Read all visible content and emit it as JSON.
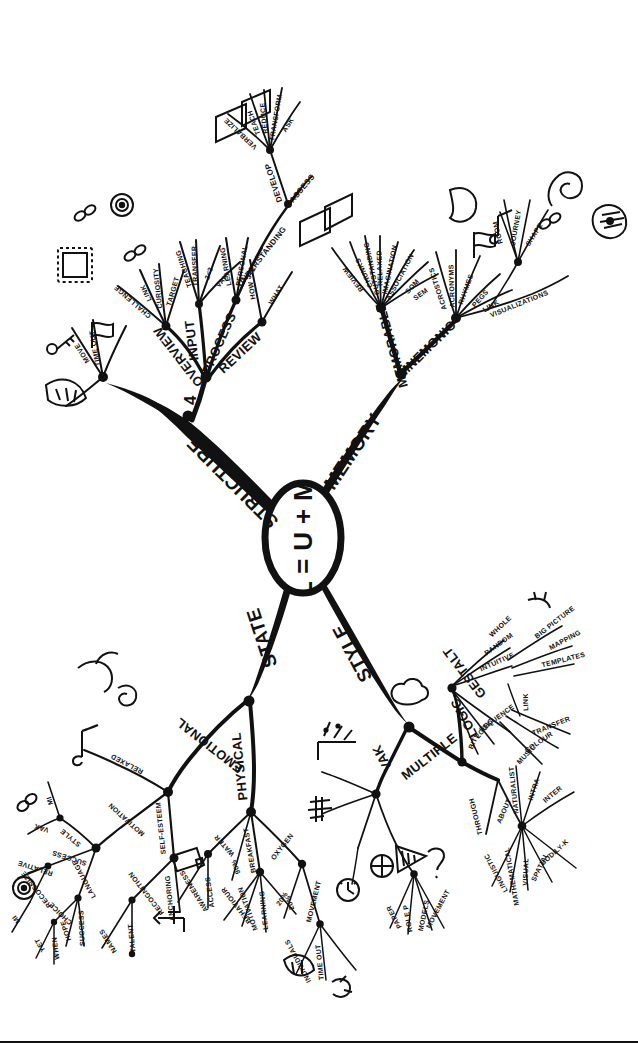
{
  "page": {
    "title": "L = U + M",
    "type": "hand-drawn mind map",
    "width": 638,
    "height": 1043,
    "ink_color": "#111111",
    "background_color": "#ffffff"
  },
  "center": {
    "label": "L = U + M"
  },
  "branches": [
    {
      "id": "structure",
      "label": "STRUCTURE",
      "sub": [
        {
          "label": "4",
          "sub": [
            {
              "label": "OVERVIEW",
              "sub": [
                {
                  "label": "CHALLENGE"
                },
                {
                  "label": "LINK"
                },
                {
                  "label": "CURIOSITY"
                },
                {
                  "label": "TARGET"
                }
              ]
            },
            {
              "label": "INPUT",
              "sub": [
                {
                  "label": "TEACHING"
                },
                {
                  "label": "TRANSFER"
                },
                {
                  "label": "2<3"
                },
                {
                  "label": "VAK"
                }
              ]
            },
            {
              "label": "PROCESS",
              "sub": [
                {
                  "label": "LEARNING"
                },
                {
                  "label": "PERSONAL"
                },
                {
                  "label": "3<2"
                },
                {
                  "label": "UNDERSTANDING",
                  "sub": [
                    {
                      "label": "DEVELOP",
                      "sub": [
                        {
                          "label": "VERBALIZE"
                        },
                        {
                          "label": "TEACH"
                        },
                        {
                          "label": "REDUCE"
                        },
                        {
                          "label": "TRANSFORM"
                        },
                        {
                          "label": "ASK"
                        }
                      ]
                    },
                    {
                      "label": "ASSESS"
                    }
                  ]
                }
              ]
            },
            {
              "label": "REVIEW",
              "sub": [
                {
                  "label": "HOW"
                },
                {
                  "label": "WHAT"
                }
              ]
            }
          ]
        },
        {
          "label": "MOVE"
        },
        {
          "label": "TIME OUT"
        }
      ]
    },
    {
      "id": "memory",
      "label": "MEMORY",
      "sub": [
        {
          "label": "MEMORABLE",
          "sub": [
            {
              "label": "REVIEW"
            },
            {
              "label": "CHUNKS"
            },
            {
              "label": "OUTSTANDING"
            },
            {
              "label": "RELAXED"
            },
            {
              "label": "IMAGINATION"
            },
            {
              "label": "ASSOCIATION"
            },
            {
              "label": "SOM"
            },
            {
              "label": "SEM"
            }
          ]
        },
        {
          "label": "MNEMONIC",
          "sub": [
            {
              "label": "ACROSTICS"
            },
            {
              "label": "ACRONYMS"
            },
            {
              "label": "RHYMES"
            },
            {
              "label": "PEGS"
            },
            {
              "label": "LINK"
            },
            {
              "label": "VISUALIZATIONS",
              "sub": [
                {
                  "label": "ROOM"
                },
                {
                  "label": "JOURNEY"
                },
                {
                  "label": "SHAPE"
                }
              ]
            }
          ]
        }
      ]
    },
    {
      "id": "state",
      "label": "STATE",
      "sub": [
        {
          "label": "EMOTIONAL",
          "sub": [
            {
              "label": "RELAXED"
            },
            {
              "label": "MOTIVATION",
              "sub": [
                {
                  "label": "STYLE",
                  "sub": [
                    {
                      "label": "VAK"
                    },
                    {
                      "label": "MI"
                    }
                  ]
                },
                {
                  "label": "SUCCESS",
                  "sub": [
                    {
                      "label": "RELATIVE"
                    },
                    {
                      "label": "RECOGNIZE"
                    },
                    {
                      "label": "MI"
                    }
                  ]
                },
                {
                  "label": "LANGUAGE",
                  "sub": [
                    {
                      "label": "CHOICE",
                      "sub": [
                        {
                          "label": "YET"
                        },
                        {
                          "label": "WHEN"
                        }
                      ]
                    },
                    {
                      "label": "HOPE"
                    },
                    {
                      "label": "SUCCESS"
                    }
                  ]
                }
              ]
            },
            {
              "label": "SELF-ESTEEM",
              "sub": [
                {
                  "label": "RECOGNITION",
                  "sub": [
                    {
                      "label": "NAMES"
                    },
                    {
                      "label": "TALENT"
                    }
                  ]
                },
                {
                  "label": "ANCHORING"
                }
              ]
            }
          ]
        },
        {
          "label": "PHYSICAL",
          "sub": [
            {
              "label": "WATER",
              "sub": [
                {
                  "label": "AWARENESS"
                },
                {
                  "label": "ACCESS"
                }
              ]
            },
            {
              "label": "BREAKFAST",
              "sub": [
                {
                  "label": "BEHAVIOUR"
                },
                {
                  "label": "MOTIVATION"
                },
                {
                  "label": "LEARNING"
                },
                {
                  "label": "20%"
                }
              ]
            },
            {
              "label": "OXYGEN",
              "sub": [
                {
                  "label": "20%"
                },
                {
                  "label": "MOVEMENT",
                  "sub": [
                    {
                      "label": "INDIVIDUALS"
                    },
                    {
                      "label": "TIME OUT"
                    }
                  ]
                }
              ]
            },
            {
              "label": "90%"
            }
          ]
        }
      ]
    },
    {
      "id": "style",
      "label": "STYLE",
      "sub": [
        {
          "label": "VAK",
          "sub": [
            {
              "label": "PAPER"
            },
            {
              "label": "ROLE P"
            },
            {
              "label": "MODELS"
            },
            {
              "label": "MOVEMENT"
            }
          ]
        },
        {
          "label": "MULTIPLE",
          "sub": [
            {
              "label": "GESTALT",
              "sub": [
                {
                  "label": "WHOLE"
                },
                {
                  "label": "RANDOM"
                },
                {
                  "label": "INTUITIVE"
                },
                {
                  "label": "BIG PICTURE"
                },
                {
                  "label": "MAPPING"
                },
                {
                  "label": "TEMPLATES"
                }
              ]
            },
            {
              "label": "LOGIC",
              "sub": [
                {
                  "label": "BITS"
                },
                {
                  "label": "LOGIC"
                },
                {
                  "label": "SEQUENCE"
                },
                {
                  "label": "MUSIC"
                },
                {
                  "label": "COLOUR"
                },
                {
                  "label": "TRANSFER"
                }
              ]
            },
            {
              "label": "LINK"
            },
            {
              "label": "THROUGH"
            },
            {
              "label": "ABOUT",
              "sub": [
                {
                  "label": "LINGUISTIC"
                },
                {
                  "label": "MATHEMATICAL"
                },
                {
                  "label": "VISUAL"
                },
                {
                  "label": "SPATIAL"
                },
                {
                  "label": "BODILY-K"
                },
                {
                  "label": "INTER"
                },
                {
                  "label": "INTRA"
                },
                {
                  "label": "NATURALIST"
                }
              ]
            }
          ]
        }
      ]
    }
  ],
  "labels": {
    "center": "L = U + M",
    "structure": "STRUCTURE",
    "memory": "MEMORY",
    "state": "STATE",
    "style": "STYLE",
    "four": "4",
    "overview": "OVERVIEW",
    "input": "INPUT",
    "process": "PROCESS",
    "review": "REVIEW",
    "challenge": "CHALLENGE",
    "link": "LINK",
    "curiosity": "CURIOSITY",
    "target": "TARGET",
    "teaching": "TEACHING",
    "transfer": "TRANSFER",
    "two_lt_three": "2<3",
    "vak": "VAK",
    "learning": "LEARNING",
    "personal": "PERSONAL",
    "three_lt_two": "3<2",
    "understanding": "UNDERSTANDING",
    "develop": "DEVELOP",
    "assess": "ASSESS",
    "verbalize": "VERBALIZE",
    "teach": "TEACH",
    "reduce": "REDUCE",
    "transform": "TRANSFORM",
    "ask": "ASK",
    "how": "HOW",
    "what": "WHAT",
    "move": "MOVE",
    "time_out": "TIME OUT",
    "memorable": "MEMORABLE",
    "mnemonic": "MNEMONIC",
    "m_review": "REVIEW",
    "chunks": "CHUNKS",
    "outstanding": "OUTSTANDING",
    "relaxed": "RELAXED",
    "imagination": "IMAGINATION",
    "association": "ASSOCIATION",
    "som": "SOM",
    "sem": "SEM",
    "acrostics": "ACROSTICS",
    "acronyms": "ACRONYMS",
    "rhymes": "RHYMES",
    "pegs": "PEGS",
    "mn_link": "LINK",
    "visualizations": "VISUALIZATIONS",
    "room": "ROOM",
    "journey": "JOURNEY",
    "shape": "SHAPE",
    "emotional": "EMOTIONAL",
    "physical": "PHYSICAL",
    "e_relaxed": "RELAXED",
    "motivation": "MOTIVATION",
    "self_esteem": "SELF-ESTEEM",
    "style_sub": "STYLE",
    "success": "SUCCESS",
    "language": "LANGUAGE",
    "relative": "RELATIVE",
    "recognize": "RECOGNIZE",
    "mi": "MI",
    "mi2": "MI",
    "choice": "CHOICE",
    "hope": "HOPE",
    "success2": "SUCCESS",
    "yet": "YET",
    "when": "WHEN",
    "recognition": "RECOGNITION",
    "anchoring": "ANCHORING",
    "names": "NAMES",
    "talent": "TALENT",
    "water": "WATER",
    "breakfast": "BREAKFAST",
    "oxygen": "OXYGEN",
    "ninety": "90%",
    "awareness": "AWARENESS",
    "access": "ACCESS",
    "behaviour": "BEHAVIOUR",
    "p_motivation": "MOTIVATION",
    "p_learning": "LEARNING",
    "twenty": "20%",
    "twenty2": "20%",
    "movement": "MOVEMENT",
    "individuals": "INDIVIDUALS",
    "p_time_out": "TIME OUT",
    "s_vak": "VAK",
    "multiple": "MULTIPLE",
    "gestalt": "GESTALT",
    "logic": "LOGIC",
    "g_link": "LINK",
    "through": "THROUGH",
    "about": "ABOUT",
    "whole": "WHOLE",
    "random": "RANDOM",
    "intuitive": "INTUITIVE",
    "big_picture": "BIG PICTURE",
    "mapping": "MAPPING",
    "templates": "TEMPLATES",
    "bits": "BITS",
    "logic2": "LOGIC",
    "sequence": "SEQUENCE",
    "music": "MUSIC",
    "colour": "COLOUR",
    "l_transfer": "TRANSFER",
    "linguistic": "LINGUISTIC",
    "mathematical": "MATHEMATICAL",
    "visual": "VISUAL",
    "spatial": "SPATIAL",
    "bodily_k": "BODILY-K",
    "inter": "INTER",
    "intra": "INTRA",
    "naturalist": "NATURALIST",
    "paper": "PAPER",
    "role_p": "ROLE P",
    "models": "MODELS",
    "s_movement": "MOVEMENT"
  }
}
